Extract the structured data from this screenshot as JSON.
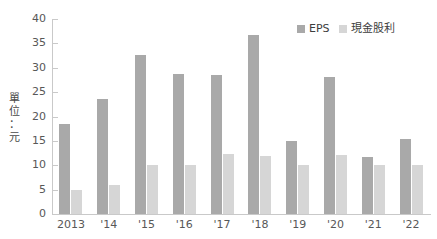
{
  "chart_data": {
    "type": "bar",
    "title": "",
    "xlabel": "",
    "ylabel": "單位：元",
    "ylim": [
      0,
      40
    ],
    "ytick_step": 5,
    "grid": false,
    "legend_position": "top-right",
    "categories": [
      "2013",
      "'14",
      "'15",
      "'16",
      "'17",
      "'18",
      "'19",
      "'20",
      "'21",
      "'22"
    ],
    "ytick_labels": [
      "40",
      "35",
      "30",
      "25",
      "20",
      "15",
      "10",
      "5",
      "0"
    ],
    "series": [
      {
        "name": "EPS",
        "color": "#a9a9a9",
        "values": [
          18.5,
          23.6,
          32.7,
          28.8,
          28.6,
          36.7,
          15.0,
          28.1,
          11.6,
          15.4
        ]
      },
      {
        "name": "現金股利",
        "color": "#d6d6d6",
        "values": [
          5.0,
          6.0,
          10.0,
          10.1,
          12.3,
          12.0,
          10.0,
          12.2,
          10.0,
          10.0
        ]
      }
    ]
  },
  "axis": {
    "y_title_chars": [
      "單",
      "位",
      "：",
      "元"
    ]
  },
  "legend": {
    "entries": [
      {
        "label": "EPS",
        "color": "#a9a9a9"
      },
      {
        "label": "現金股利",
        "color": "#d6d6d6"
      }
    ]
  }
}
